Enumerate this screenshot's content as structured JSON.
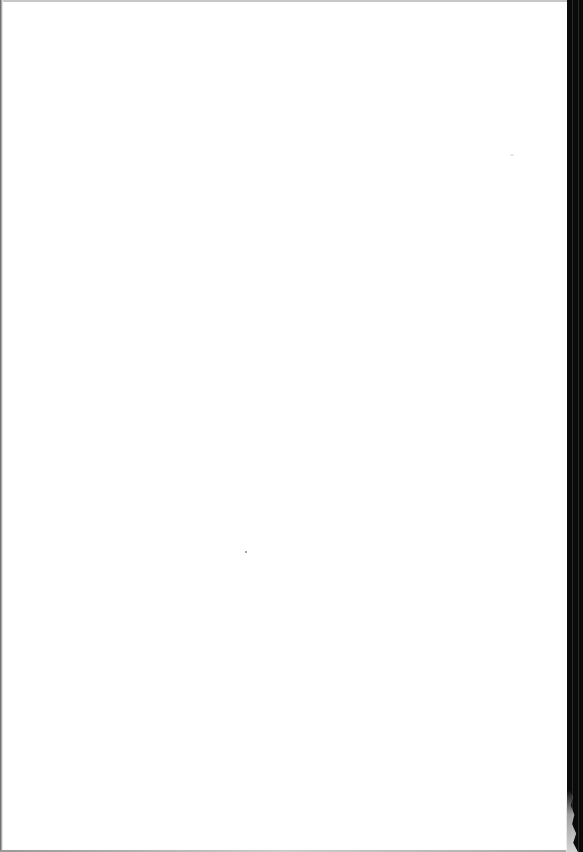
{
  "document": {
    "type": "scanned-page",
    "content": "",
    "is_blank": true
  },
  "colors": {
    "paper": "#ffffff",
    "scan_border": "#0a0a0a"
  }
}
